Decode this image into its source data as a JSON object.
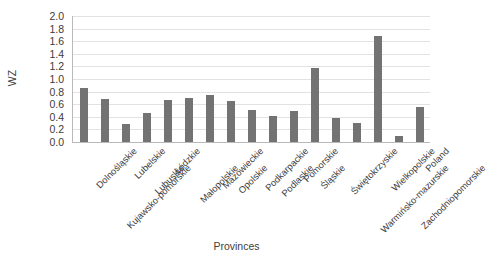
{
  "chart_data": {
    "type": "bar",
    "title": "",
    "xlabel": "Provinces",
    "ylabel": "WZ",
    "ylim": [
      0.0,
      2.0
    ],
    "ytick_step": 0.2,
    "yticks": [
      "2.0",
      "1.8",
      "1.6",
      "1.4",
      "1.2",
      "1.0",
      "0.8",
      "0.6",
      "0.4",
      "0.2",
      "0.0"
    ],
    "grid": true,
    "legend": null,
    "bar_color": "#737373",
    "categories": [
      "Dolnośląskie",
      "Kujawsko-pomorskie",
      "Lubelskie",
      "Lubuskie",
      "Łódzkie",
      "Małopolskie",
      "Mazowieckie",
      "Opolskie",
      "Podkarpackie",
      "Podlaskie",
      "Pomorskie",
      "Śląskie",
      "Świętokrzyskie",
      "Warmińsko-mazurskie",
      "Wielkopolskie",
      "Zachodniopomorskie",
      "Poland"
    ],
    "values": [
      0.85,
      0.68,
      0.28,
      0.46,
      0.66,
      0.7,
      0.75,
      0.65,
      0.51,
      0.42,
      0.49,
      1.17,
      0.38,
      0.3,
      1.68,
      0.1,
      0.55
    ]
  }
}
